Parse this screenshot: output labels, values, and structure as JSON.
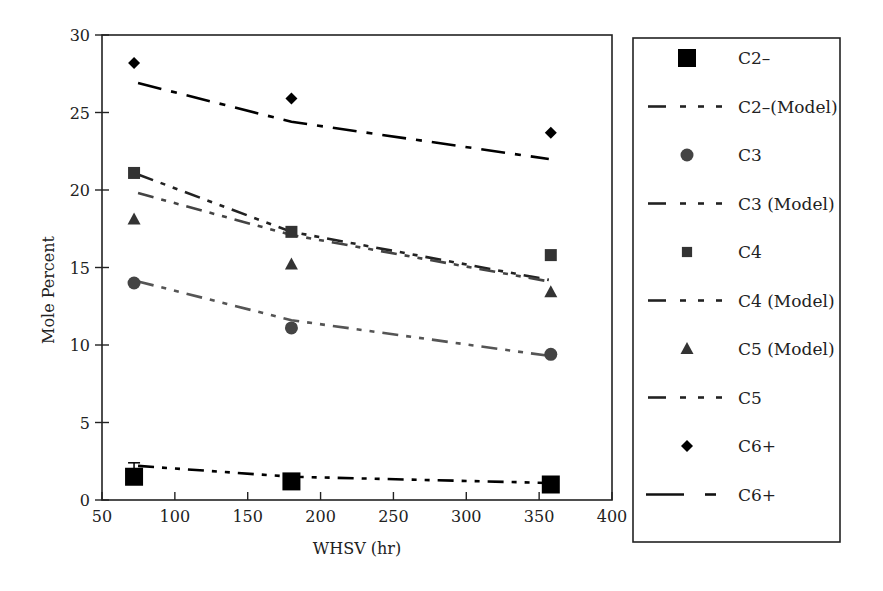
{
  "chart_data": {
    "type": "scatter",
    "title": "",
    "xlabel": "WHSV (hr)",
    "ylabel": "Mole Percent",
    "xlim": [
      50,
      400
    ],
    "ylim": [
      0,
      30
    ],
    "xticks": [
      50,
      100,
      150,
      200,
      250,
      300,
      350,
      400
    ],
    "yticks": [
      0,
      5,
      10,
      15,
      20,
      25,
      30
    ],
    "grid": false,
    "legend_position": "right-outside",
    "x": [
      72,
      180,
      358
    ],
    "series": [
      {
        "name": "C2–",
        "kind": "marker",
        "marker": "square-large",
        "color": "#000000",
        "values": [
          1.5,
          1.2,
          1.0
        ],
        "error_bar": [
          0.9,
          null,
          null
        ]
      },
      {
        "name": "C2–(Model)",
        "kind": "line",
        "dash": "dash-dot-dot",
        "color": "#000000",
        "values": [
          2.2,
          1.5,
          1.1
        ]
      },
      {
        "name": "C3",
        "kind": "marker",
        "marker": "circle",
        "color": "#444444",
        "values": [
          14.0,
          11.1,
          9.4
        ]
      },
      {
        "name": "C3 (Model)",
        "kind": "line",
        "dash": "dash-dot-dot",
        "color": "#555555",
        "values": [
          14.1,
          11.6,
          9.3
        ]
      },
      {
        "name": "C4",
        "kind": "marker",
        "marker": "square",
        "color": "#333333",
        "values": [
          21.1,
          17.3,
          15.8
        ]
      },
      {
        "name": "C4 (Model)",
        "kind": "line",
        "dash": "dash-dot-dot",
        "color": "#222222",
        "values": [
          21.0,
          17.3,
          14.2
        ]
      },
      {
        "name": "C5 (Model)",
        "kind": "marker",
        "marker": "triangle",
        "color": "#333333",
        "values": [
          18.1,
          15.2,
          13.4
        ]
      },
      {
        "name": "C5",
        "kind": "line",
        "dash": "dash-dot-dot",
        "color": "#444444",
        "values": [
          19.8,
          17.1,
          14.1
        ]
      },
      {
        "name": "C6+",
        "kind": "marker",
        "marker": "diamond",
        "color": "#000000",
        "values": [
          28.2,
          25.9,
          23.7
        ]
      },
      {
        "name": "C6+",
        "kind": "line",
        "dash": "long-dash-dot",
        "color": "#000000",
        "values": [
          26.9,
          24.4,
          22.0
        ]
      }
    ]
  },
  "legend": {
    "items": [
      {
        "label": "C2–",
        "symbol": "square-large"
      },
      {
        "label": "C2–(Model)",
        "symbol": "line"
      },
      {
        "label": "C3",
        "symbol": "circle"
      },
      {
        "label": "C3 (Model)",
        "symbol": "line"
      },
      {
        "label": "C4",
        "symbol": "square"
      },
      {
        "label": "C4 (Model)",
        "symbol": "line"
      },
      {
        "label": "C5 (Model)",
        "symbol": "triangle"
      },
      {
        "label": "C5",
        "symbol": "line"
      },
      {
        "label": "C6+",
        "symbol": "diamond"
      },
      {
        "label": "C6+",
        "symbol": "line-long"
      }
    ]
  },
  "axes": {
    "x_title": "WHSV (hr)",
    "y_title": "Mole Percent",
    "x_tick_labels": [
      "50",
      "100",
      "150",
      "200",
      "250",
      "300",
      "350",
      "400"
    ],
    "y_tick_labels": [
      "0",
      "5",
      "10",
      "15",
      "20",
      "25",
      "30"
    ]
  }
}
